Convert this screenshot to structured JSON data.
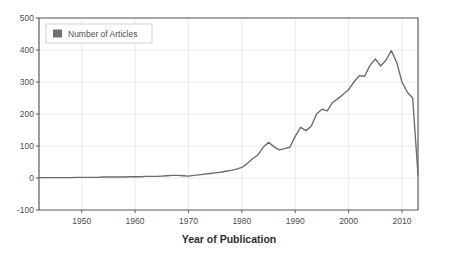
{
  "chart_data": {
    "type": "line",
    "title": "",
    "xlabel": "Year of Publication",
    "ylabel": "",
    "xlim": [
      1942,
      2013
    ],
    "ylim": [
      -100,
      500
    ],
    "grid": true,
    "legend_position": "top-left",
    "legend": [
      "Number of Articles"
    ],
    "xticks": [
      1950,
      1960,
      1970,
      1980,
      1990,
      2000,
      2010
    ],
    "yticks": [
      -100,
      0,
      100,
      200,
      300,
      400,
      500
    ],
    "series": [
      {
        "name": "Number of Articles",
        "color": "#6b6b6b",
        "x": [
          1942,
          1943,
          1944,
          1945,
          1946,
          1947,
          1948,
          1949,
          1950,
          1951,
          1952,
          1953,
          1954,
          1955,
          1956,
          1957,
          1958,
          1959,
          1960,
          1961,
          1962,
          1963,
          1964,
          1965,
          1966,
          1967,
          1968,
          1969,
          1970,
          1971,
          1972,
          1973,
          1974,
          1975,
          1976,
          1977,
          1978,
          1979,
          1980,
          1981,
          1982,
          1983,
          1984,
          1985,
          1986,
          1987,
          1988,
          1989,
          1990,
          1991,
          1992,
          1993,
          1994,
          1995,
          1996,
          1997,
          1998,
          1999,
          2000,
          2001,
          2002,
          2003,
          2004,
          2005,
          2006,
          2007,
          2008,
          2009,
          2010,
          2011,
          2012,
          2013
        ],
        "values": [
          1,
          1,
          1,
          1,
          1,
          1,
          1,
          2,
          2,
          2,
          2,
          2,
          3,
          3,
          3,
          3,
          3,
          4,
          4,
          4,
          5,
          5,
          5,
          6,
          7,
          8,
          8,
          7,
          6,
          8,
          10,
          12,
          14,
          16,
          18,
          21,
          24,
          28,
          33,
          45,
          60,
          72,
          96,
          112,
          98,
          88,
          92,
          96,
          130,
          158,
          148,
          162,
          200,
          215,
          210,
          236,
          248,
          262,
          276,
          300,
          320,
          318,
          352,
          372,
          350,
          368,
          398,
          362,
          300,
          268,
          250,
          10
        ]
      }
    ]
  },
  "legend": {
    "entries": [
      {
        "label": "Number of Articles",
        "swatch_color": "#707070"
      }
    ]
  },
  "axes": {
    "x_title": "Year of Publication",
    "x_tick_labels": [
      "1950",
      "1960",
      "1970",
      "1980",
      "1990",
      "2000",
      "2010"
    ],
    "y_tick_labels": [
      "500",
      "400",
      "300",
      "200",
      "100",
      "0",
      "-100"
    ]
  },
  "colors": {
    "line": "#6b6b6b",
    "grid": "#e3e3e3",
    "axis": "#5a5a5a",
    "text": "#4d4d4d",
    "background": "#ffffff"
  }
}
